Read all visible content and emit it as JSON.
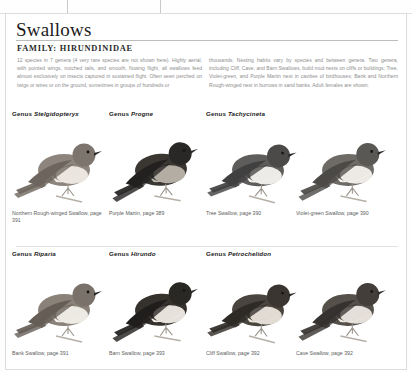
{
  "page": {
    "title": "Swallows",
    "family": "FAMILY: HIRUNDINIDAE",
    "intro_left": "12 species in 7 genera (4 very rare species are not shown here). Highly aerial, with pointed wings, notched tails, and smooth, flowing flight, all swallows feed almost exclusively on insects captured in sustained flight. Often seen perched on twigs or wires or on the ground, sometimes in groups of hundreds or",
    "intro_right": "thousands. Nesting habits vary by species and between genera. Two genera, including Cliff, Cave, and Barn Swallows, build mud nests on cliffs or buildings; Tree, Violet-green, and Purple Martin nest in cavities of birdhouses; Bank and Northern Rough-winged nest in burrows in sand banks. Adult females are shown."
  },
  "colors": {
    "text": "#1a1a1a",
    "muted": "#8e8e8e",
    "caption": "#5d5d5d",
    "rule": "#bdbdbd",
    "guide": "#c9c9c9"
  },
  "plates": [
    {
      "genus_label": "Genus",
      "genus_name": "Stelgidopteryx",
      "caption": "Northern Rough-winged Swallow, page 391",
      "body": "#8d857d",
      "belly": "#efeae4",
      "wing": "#6d655d",
      "head": "#7d756d"
    },
    {
      "genus_label": "Genus",
      "genus_name": "Progne",
      "caption": "Purple Martin, page 389",
      "body": "#3a3732",
      "belly": "#b9b3aa",
      "wing": "#232120",
      "head": "#2a2826"
    },
    {
      "genus_label": "Genus",
      "genus_name": "Tachycineta",
      "caption": "Tree Swallow, page 390",
      "body": "#5f5d5b",
      "belly": "#f4f2ef",
      "wing": "#414040",
      "head": "#4b4a48"
    },
    {
      "genus_label": "",
      "genus_name": "",
      "caption": "Violet-green Swallow, page 390",
      "body": "#6e6b66",
      "belly": "#f3f1ed",
      "wing": "#4c4a47",
      "head": "#5a5854"
    },
    {
      "genus_label": "Genus",
      "genus_name": "Riparia",
      "caption": "Bank Swallow, page 391",
      "body": "#8a8179",
      "belly": "#f2efe9",
      "wing": "#655d56",
      "head": "#7a726a"
    },
    {
      "genus_label": "Genus",
      "genus_name": "Hirundo",
      "caption": "Barn Swallow, page 393",
      "body": "#35322e",
      "belly": "#f0ece5",
      "wing": "#201e1c",
      "head": "#2a2825"
    },
    {
      "genus_label": "Genus",
      "genus_name": "Petrochelidon",
      "caption": "Cliff Swallow, page 392",
      "body": "#4a443e",
      "belly": "#e9e4dc",
      "wing": "#2e2a26",
      "head": "#3a3530"
    },
    {
      "genus_label": "",
      "genus_name": "",
      "caption": "Cave Swallow, page 392",
      "body": "#56504a",
      "belly": "#ece7df",
      "wing": "#363230",
      "head": "#433e39"
    }
  ]
}
